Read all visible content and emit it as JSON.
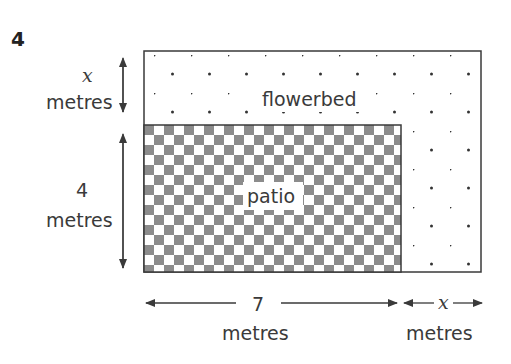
{
  "question_number": "4",
  "regions": {
    "flowerbed": {
      "label": "flowerbed",
      "fill": "dotted"
    },
    "patio": {
      "label": "patio",
      "fill": "checkerboard"
    }
  },
  "dimensions": {
    "top_strip_height": {
      "value": "x",
      "unit": "metres"
    },
    "patio_height": {
      "value": "4",
      "unit": "metres"
    },
    "patio_width": {
      "value": "7",
      "unit": "metres"
    },
    "side_strip_width": {
      "value": "x",
      "unit": "metres"
    }
  },
  "colors": {
    "outline": "#3a3a3a",
    "checker_dark": "#8c8c8c",
    "checker_light": "#ffffff",
    "dot": "#333333",
    "text": "#3a3a3a"
  }
}
